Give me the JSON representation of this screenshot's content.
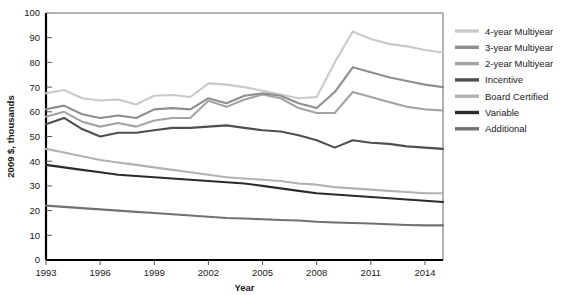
{
  "chart_data": {
    "type": "line",
    "title": "",
    "xlabel": "Year",
    "ylabel": "2009 $, thousands",
    "xlim": [
      1993,
      2015
    ],
    "ylim": [
      0,
      100
    ],
    "ytick_interval": 10,
    "yticks": [
      0,
      10,
      20,
      30,
      40,
      50,
      60,
      70,
      80,
      90,
      100
    ],
    "xticks": [
      1993,
      1996,
      1999,
      2002,
      2005,
      2008,
      2011,
      2014
    ],
    "xtick_labels": [
      "1993",
      "1996",
      "1999",
      "2002",
      "2005",
      "2008",
      "2011",
      "2014"
    ],
    "ytick_labels": [
      "0",
      "10",
      "20",
      "30",
      "40",
      "50",
      "60",
      "70",
      "80",
      "90",
      "100"
    ],
    "grid": false,
    "legend_position": "right",
    "x": [
      1993,
      1994,
      1995,
      1996,
      1997,
      1998,
      1999,
      2000,
      2001,
      2002,
      2003,
      2004,
      2005,
      2006,
      2007,
      2008,
      2009,
      2010,
      2011,
      2012,
      2013,
      2014,
      2015
    ],
    "series": [
      {
        "name": "4-year Multiyear",
        "color": "#c9c9c9",
        "values": [
          67.5,
          68.8,
          65.5,
          64.6,
          65.0,
          63.0,
          66.5,
          66.8,
          66.0,
          71.5,
          71.0,
          70.0,
          68.5,
          67.0,
          65.5,
          66.0,
          80.0,
          92.5,
          89.5,
          87.5,
          86.5,
          85.0,
          84.0
        ]
      },
      {
        "name": "3-year Multiyear",
        "color": "#8e8e8e",
        "values": [
          61.0,
          62.5,
          59.0,
          57.5,
          58.5,
          57.5,
          61.0,
          61.5,
          61.0,
          65.5,
          63.5,
          66.5,
          67.5,
          66.5,
          63.5,
          61.5,
          68.0,
          78.0,
          76.0,
          74.0,
          72.5,
          71.0,
          70.0
        ]
      },
      {
        "name": "2-year Multiyear",
        "color": "#a3a3a3",
        "values": [
          58.0,
          60.0,
          56.0,
          54.0,
          55.5,
          54.0,
          56.5,
          57.5,
          57.5,
          64.5,
          62.0,
          65.0,
          67.0,
          65.5,
          61.5,
          59.5,
          59.5,
          68.0,
          66.0,
          64.0,
          62.0,
          61.0,
          60.5
        ]
      },
      {
        "name": "Incentive",
        "color": "#4f4f4f",
        "values": [
          55.0,
          57.5,
          53.0,
          50.0,
          51.5,
          51.5,
          52.5,
          53.5,
          53.5,
          54.0,
          54.5,
          53.5,
          52.5,
          52.0,
          50.5,
          48.5,
          45.5,
          48.5,
          47.5,
          47.0,
          46.0,
          45.5,
          45.0
        ]
      },
      {
        "name": "Board Certified",
        "color": "#b2b2b2",
        "values": [
          45.0,
          43.5,
          42.0,
          40.5,
          39.5,
          38.5,
          37.5,
          36.5,
          35.5,
          34.5,
          33.5,
          33.0,
          32.5,
          32.0,
          31.0,
          30.5,
          29.5,
          29.0,
          28.5,
          28.0,
          27.5,
          27.0,
          27.0
        ]
      },
      {
        "name": "Variable",
        "color": "#2b2b2b",
        "values": [
          38.5,
          37.5,
          36.5,
          35.5,
          34.5,
          34.0,
          33.5,
          33.0,
          32.5,
          32.0,
          31.5,
          31.0,
          30.0,
          29.0,
          28.0,
          27.0,
          26.5,
          26.0,
          25.5,
          25.0,
          24.5,
          24.0,
          23.5
        ]
      },
      {
        "name": "Additional",
        "color": "#717171",
        "values": [
          22.0,
          21.5,
          21.0,
          20.5,
          20.0,
          19.5,
          19.0,
          18.5,
          18.0,
          17.5,
          17.0,
          16.8,
          16.5,
          16.2,
          16.0,
          15.5,
          15.2,
          15.0,
          14.8,
          14.5,
          14.2,
          14.0,
          14.0
        ]
      }
    ]
  }
}
